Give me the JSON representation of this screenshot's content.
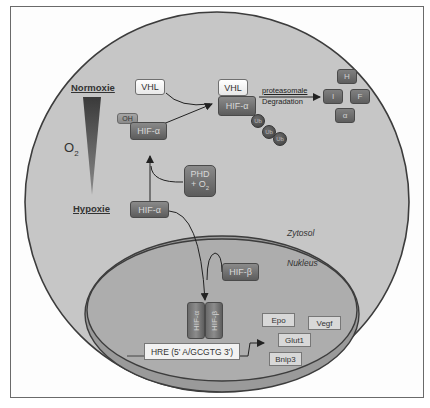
{
  "diagram": {
    "title_left_top": "Normoxie",
    "title_left_bottom": "Hypoxie",
    "gradient_label": "O",
    "gradient_label_sub": "2",
    "compartments": {
      "cytosol": "Zytosol",
      "nucleus": "Nukleus"
    },
    "normoxia": {
      "vhl_free": "VHL",
      "oh": "OH",
      "hif_alpha_hydroxylated": "HIF-α",
      "vhl_bound": "VHL",
      "hif_alpha_bound": "HIF-α",
      "ubiquitin": [
        "Ub",
        "Ub",
        "Ub"
      ],
      "degradation_line1": "proteasomale",
      "degradation_line2": "Degradation",
      "fragments": [
        "H",
        "I",
        "F",
        "α"
      ]
    },
    "phd": {
      "line1": "PHD",
      "line2": "+ O",
      "line2_sub": "2"
    },
    "hypoxia": {
      "hif_alpha": "HIF-α",
      "hif_beta": "HIF-β",
      "dimer_alpha": "HIF-α",
      "dimer_beta": "HIF-β",
      "hre": "HRE (5' A/GCGTG 3')",
      "target_genes": [
        "Epo",
        "Vegf",
        "Glut1",
        "Bnip3"
      ]
    },
    "colors": {
      "cell_fill": "#c4c4c4",
      "nucleus_fill": "#a9a9a9",
      "outline": "#3c3c3c",
      "dark_box": "#6a6a6a",
      "frame": "#6a6a6a"
    }
  }
}
